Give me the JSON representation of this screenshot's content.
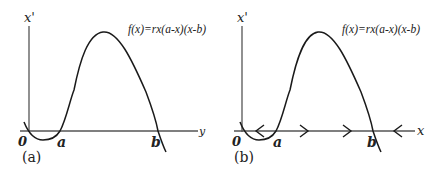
{
  "panels": [
    {
      "id": "a",
      "panel_label": "(a)",
      "y_axis_label": "x'",
      "x_axis_label": "y",
      "formula": "f(x)=rx(a-x)(x-b)",
      "origin_label": "0",
      "root_a_label": "a",
      "root_b_label": "b"
    },
    {
      "id": "b",
      "panel_label": "(b)",
      "y_axis_label": "x'",
      "x_axis_label": "x",
      "formula": "f(x)=rx(a-x)(x-b)",
      "origin_label": "0",
      "root_a_label": "a",
      "root_b_label": "b",
      "flow_arrows": [
        "left",
        "right",
        "right",
        "left"
      ]
    }
  ],
  "colors": {
    "curve": "#1a1a1a",
    "axis": "#555555",
    "background": "#ffffff"
  }
}
